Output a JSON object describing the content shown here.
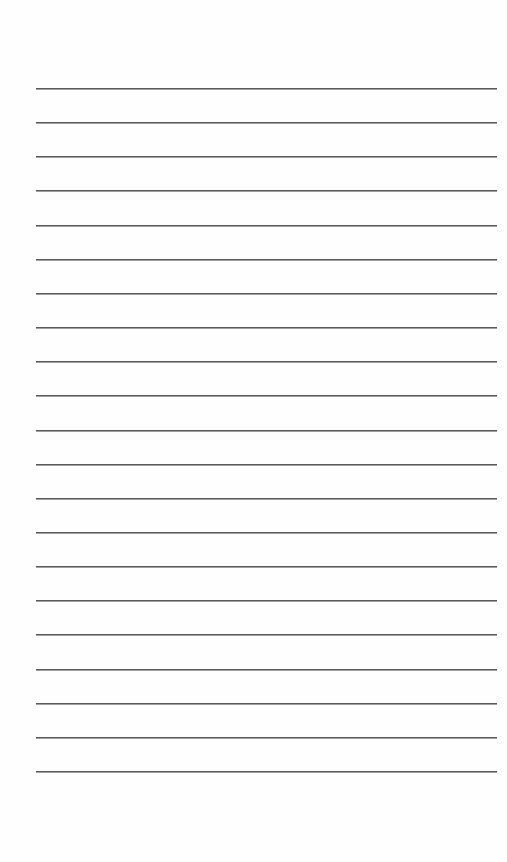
{
  "page": {
    "type": "lined-paper",
    "line_count": 21,
    "first_line_y": 88,
    "line_spacing": 34.15,
    "line_left": 36,
    "line_right": 497,
    "line_color": "#5a5a5a",
    "background_color": "#fefefe"
  }
}
